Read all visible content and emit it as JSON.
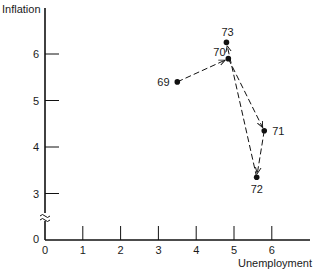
{
  "chart_data": {
    "type": "scatter",
    "title": "",
    "xlabel": "Unemployment",
    "ylabel": "Inflation",
    "x_ticks": [
      "0",
      "1",
      "2",
      "3",
      "4",
      "5",
      "6"
    ],
    "y_ticks": [
      "0",
      "3",
      "4",
      "5",
      "6"
    ],
    "xlim": [
      0,
      7
    ],
    "ylim": [
      0,
      7
    ],
    "y_axis_break": "between 0 and 3",
    "grid": false,
    "legend": null,
    "points": [
      {
        "label": "69",
        "x": 3.5,
        "y": 5.4
      },
      {
        "label": "70",
        "x": 4.85,
        "y": 5.9
      },
      {
        "label": "71",
        "x": 5.8,
        "y": 4.35
      },
      {
        "label": "72",
        "x": 5.6,
        "y": 3.35
      },
      {
        "label": "73",
        "x": 4.8,
        "y": 6.25
      }
    ],
    "path": [
      {
        "from": "69",
        "to": "70",
        "style": "dashed-arrow"
      },
      {
        "from": "70",
        "to": "71",
        "style": "dashed-arrow"
      },
      {
        "from": "71",
        "to": "72",
        "style": "dashed-arrow"
      },
      {
        "from": "72",
        "to": "73",
        "style": "dashed-arrow"
      }
    ]
  },
  "labels": {
    "y_axis": "Inflation",
    "x_axis": "Unemployment",
    "y_zero": "0",
    "x_zero": "0"
  }
}
